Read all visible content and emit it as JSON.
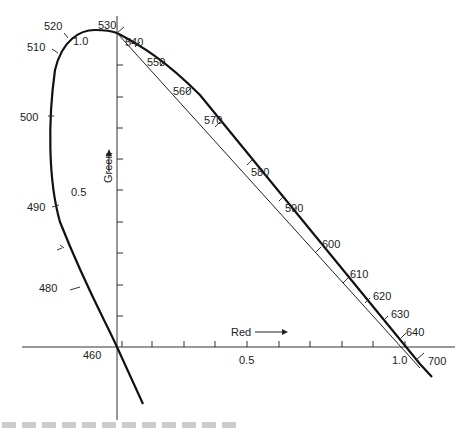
{
  "diagram": {
    "type": "chromaticity-diagram-rg",
    "x_axis": {
      "label": "Red",
      "ticks": [
        "0.5",
        "1.0"
      ]
    },
    "y_axis": {
      "label": "Green",
      "ticks": [
        "0.5",
        "1.0"
      ]
    },
    "origin_label": "460",
    "wavelength_labels": [
      "460",
      "480",
      "490",
      "500",
      "510",
      "520",
      "530",
      "540",
      "550",
      "560",
      "570",
      "580",
      "590",
      "600",
      "610",
      "620",
      "630",
      "640",
      "700"
    ]
  },
  "labels": {
    "w460": "460",
    "w480": "480",
    "w490": "490",
    "w500": "500",
    "w510": "510",
    "w520": "520",
    "w530": "530",
    "w540": "540",
    "w550": "550",
    "w560": "560",
    "w570": "570",
    "w580": "580",
    "w590": "590",
    "w600": "600",
    "w610": "610",
    "w620": "620",
    "w630": "630",
    "w640": "640",
    "w700": "700",
    "x_half": "0.5",
    "x_one": "1.0",
    "y_half": "0.5",
    "y_one": "1.0",
    "red": "Red",
    "green": "Green"
  }
}
